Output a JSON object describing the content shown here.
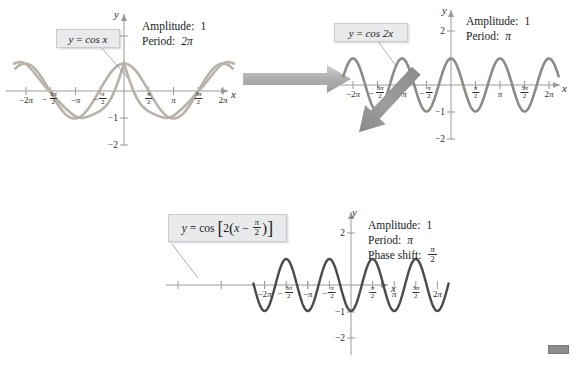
{
  "figure": {
    "type": "math-transformation-diagram",
    "topic": "Cosine graph transformations: period change and phase shift"
  },
  "colors": {
    "curve_light": "#b9b2a9",
    "curve_mid": "#8e8a86",
    "curve_dark": "#4a4a4a",
    "axis": "#9a9a9a",
    "arrow_light": "#b3b3b3",
    "arrow_dark": "#8a8a8a",
    "callout_bg": "#e8eaec",
    "callout_border": "#c8ccd0",
    "text": "#1a1a1a"
  },
  "panels": [
    {
      "id": "panel-1",
      "callout": {
        "lhs": "y",
        "eq": "=",
        "rhs": "cos x"
      },
      "info": [
        {
          "label": "Amplitude:",
          "value": "1",
          "italic": false
        },
        {
          "label": "Period:",
          "value": "2π",
          "italic": true
        }
      ],
      "axis": {
        "x_label": "x",
        "y_label": "y",
        "y_ticks": [
          "2",
          "−1",
          "−2"
        ],
        "x_ticks": [
          {
            "text": "−2π"
          },
          {
            "text": "−3π/2",
            "num": "3π",
            "den": "2",
            "sign": "−"
          },
          {
            "text": "−π"
          },
          {
            "text": "−π/2",
            "num": "π",
            "den": "2",
            "sign": "−"
          },
          {
            "text": "π/2",
            "num": "π",
            "den": "2",
            "sign": ""
          },
          {
            "text": "π"
          },
          {
            "text": "3π/2",
            "num": "3π",
            "den": "2",
            "sign": ""
          },
          {
            "text": "2π"
          }
        ]
      },
      "chart_data": {
        "type": "line",
        "function": "y = cos(x)",
        "amplitude": 1,
        "period": 6.283185307,
        "phase_shift": 0,
        "xlim": [
          -6.283185307,
          6.283185307
        ],
        "ylim": [
          -2.6,
          2.6
        ],
        "grid": false
      }
    },
    {
      "id": "panel-2",
      "callout": {
        "lhs": "y",
        "eq": "=",
        "rhs": "cos 2x"
      },
      "info": [
        {
          "label": "Amplitude:",
          "value": "1",
          "italic": false
        },
        {
          "label": "Period:",
          "value": "π",
          "italic": true
        }
      ],
      "axis": {
        "x_label": "x",
        "y_label": "y",
        "y_ticks": [
          "2",
          "−1",
          "−2"
        ],
        "x_ticks": [
          {
            "text": "−2π"
          },
          {
            "text": "−3π/2",
            "num": "3π",
            "den": "2",
            "sign": "−"
          },
          {
            "text": "−π"
          },
          {
            "text": "−π/2",
            "num": "π",
            "den": "2",
            "sign": "−"
          },
          {
            "text": "π/2",
            "num": "π",
            "den": "2",
            "sign": ""
          },
          {
            "text": "π"
          },
          {
            "text": "3π/2",
            "num": "3π",
            "den": "2",
            "sign": ""
          },
          {
            "text": "2π"
          }
        ]
      },
      "chart_data": {
        "type": "line",
        "function": "y = cos(2x)",
        "amplitude": 1,
        "period": 3.141592653,
        "phase_shift": 0,
        "xlim": [
          -6.283185307,
          6.283185307
        ],
        "ylim": [
          -2.6,
          2.6
        ],
        "grid": false
      }
    },
    {
      "id": "panel-3",
      "callout": {
        "lhs": "y",
        "eq": "=",
        "rhs": "cos",
        "bracket_open": "[",
        "coef": "2",
        "paren_open": "(",
        "var": "x",
        "minus": "−",
        "frac_num": "π",
        "frac_den": "2",
        "paren_close": ")",
        "bracket_close": "]"
      },
      "info": [
        {
          "label": "Amplitude:",
          "value": "1",
          "italic": false
        },
        {
          "label": "Period:",
          "value": "π",
          "italic": true
        },
        {
          "label": "Phase shift:",
          "value": "π/2",
          "num": "π",
          "den": "2",
          "italic": true
        }
      ],
      "axis": {
        "x_label": "x",
        "y_label": "y",
        "y_ticks": [
          "2",
          "−1",
          "−2"
        ],
        "x_ticks": [
          {
            "text": "−2π"
          },
          {
            "text": "−3π/2",
            "num": "3π",
            "den": "2",
            "sign": "−"
          },
          {
            "text": "−π"
          },
          {
            "text": "−π/2",
            "num": "π",
            "den": "2",
            "sign": "−"
          },
          {
            "text": "π/2",
            "num": "π",
            "den": "2",
            "sign": ""
          },
          {
            "text": "π"
          },
          {
            "text": "3π/2",
            "num": "3π",
            "den": "2",
            "sign": ""
          },
          {
            "text": "2π"
          }
        ]
      },
      "chart_data": {
        "type": "line",
        "function": "y = cos[2(x - π/2)]",
        "amplitude": 1,
        "period": 3.141592653,
        "phase_shift": 1.570796327,
        "xlim": [
          -6.283185307,
          6.283185307
        ],
        "ylim": [
          -2.6,
          2.6
        ],
        "grid": false
      }
    }
  ],
  "arrows": [
    {
      "id": "arrow-right",
      "direction": "right",
      "from": "panel-1",
      "to": "panel-2"
    },
    {
      "id": "arrow-diagonal",
      "direction": "down-left",
      "from": "panel-2",
      "to": "panel-3"
    }
  ]
}
